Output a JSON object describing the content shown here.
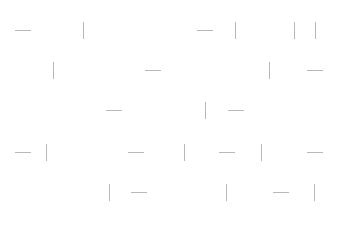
{
  "canvas": {
    "width": 337,
    "height": 227,
    "background": "#ffffff",
    "stroke_color": "#b8b8b8"
  },
  "segments": [
    {
      "o": "h",
      "x": 15,
      "y": 30
    },
    {
      "o": "v",
      "x": 83,
      "y": 22
    },
    {
      "o": "h",
      "x": 197,
      "y": 30
    },
    {
      "o": "v",
      "x": 235,
      "y": 22
    },
    {
      "o": "v",
      "x": 294,
      "y": 22
    },
    {
      "o": "v",
      "x": 315,
      "y": 22
    },
    {
      "o": "v",
      "x": 53,
      "y": 62
    },
    {
      "o": "h",
      "x": 145,
      "y": 70
    },
    {
      "o": "v",
      "x": 269,
      "y": 62
    },
    {
      "o": "h",
      "x": 307,
      "y": 70
    },
    {
      "o": "h",
      "x": 106,
      "y": 110
    },
    {
      "o": "v",
      "x": 205,
      "y": 102
    },
    {
      "o": "h",
      "x": 228,
      "y": 110
    },
    {
      "o": "h",
      "x": 15,
      "y": 152
    },
    {
      "o": "v",
      "x": 46,
      "y": 144
    },
    {
      "o": "h",
      "x": 128,
      "y": 152
    },
    {
      "o": "v",
      "x": 184,
      "y": 144
    },
    {
      "o": "h",
      "x": 219,
      "y": 152
    },
    {
      "o": "v",
      "x": 261,
      "y": 144
    },
    {
      "o": "h",
      "x": 307,
      "y": 152
    },
    {
      "o": "v",
      "x": 109,
      "y": 184
    },
    {
      "o": "h",
      "x": 131,
      "y": 192
    },
    {
      "o": "v",
      "x": 226,
      "y": 184
    },
    {
      "o": "h",
      "x": 273,
      "y": 192
    },
    {
      "o": "v",
      "x": 314,
      "y": 184
    }
  ]
}
